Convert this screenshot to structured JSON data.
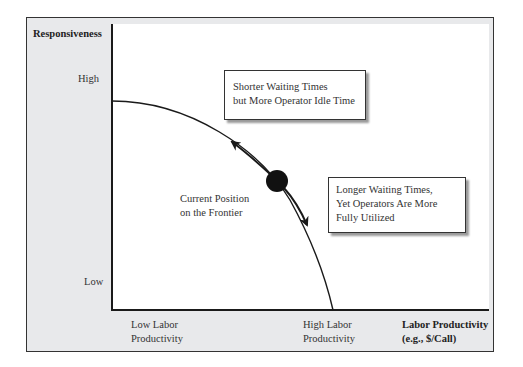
{
  "diagram": {
    "y_axis": {
      "title": "Responsiveness",
      "high_label": "High",
      "low_label": "Low"
    },
    "x_axis": {
      "title_line1": "Labor Productivity",
      "title_line2": "(e.g., $/Call)",
      "low_label_line1": "Low Labor",
      "low_label_line2": "Productivity",
      "high_label_line1": "High Labor",
      "high_label_line2": "Productivity"
    },
    "callouts": {
      "upper": {
        "line1": "Shorter Waiting Times",
        "line2": "but More Operator Idle Time"
      },
      "lower": {
        "line1": "Longer Waiting Times,",
        "line2": "Yet Operators Are More",
        "line3": "Fully Utilized"
      }
    },
    "current_position": {
      "line1": "Current Position",
      "line2": "on the Frontier"
    },
    "colors": {
      "frame_background": "#e8e9eb",
      "plot_background": "#ffffff",
      "line": "#1a1a1a"
    }
  }
}
